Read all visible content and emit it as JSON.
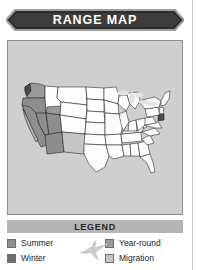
{
  "figure": {
    "title": "RANGE MAP",
    "title_bar_color": "#3c3c3c",
    "panel_background": "#cfcfcf"
  },
  "legend": {
    "header": "LEGEND",
    "decoration_icon": "flying-bird-icon",
    "items": [
      {
        "label": "Summer",
        "color": "#8d8d8d"
      },
      {
        "label": "Winter",
        "color": "#6e6e6e"
      },
      {
        "label": "Year-round",
        "color": "#9a9a9a"
      },
      {
        "label": "Migration",
        "color": "#c6c6c6"
      }
    ]
  },
  "map": {
    "region": "United States",
    "fill_unmarked": "#fdfdfd",
    "outline_color": "#1e1e1e",
    "lakes_color": "#e3e3e3",
    "ranges": [
      {
        "area": "Pacific Northwest coast",
        "category": "Year-round"
      },
      {
        "area": "California",
        "category": "Summer"
      },
      {
        "area": "Great Basin",
        "category": "Summer"
      },
      {
        "area": "Desert Southwest",
        "category": "Summer"
      },
      {
        "area": "Southern Rockies",
        "category": "Migration"
      },
      {
        "area": "Eastern United States",
        "category": "Not present"
      }
    ]
  }
}
